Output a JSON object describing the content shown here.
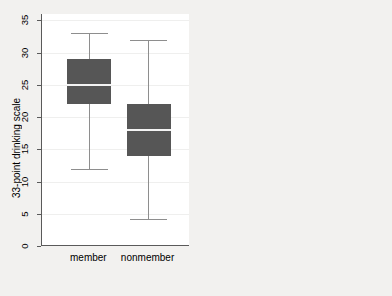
{
  "chart_data": [
    {
      "type": "box",
      "panel": "left",
      "title": "",
      "xlabel": "",
      "ylabel": "33-point drinking scale",
      "ylim": [
        0,
        36
      ],
      "yticks": [
        0,
        5,
        10,
        15,
        20,
        25,
        30,
        35
      ],
      "ytick_labels": [
        "0",
        "5",
        "10",
        "15",
        "20",
        "25",
        "30",
        "35"
      ],
      "grid": true,
      "legend": "none",
      "categories": [
        "member",
        "nonmember"
      ],
      "boxes": [
        {
          "name": "member",
          "whisker_low": 12,
          "q1": 22,
          "median": 25,
          "q3": 29,
          "whisker_high": 33
        },
        {
          "name": "nonmember",
          "whisker_low": 4.2,
          "q1": 14,
          "median": 18,
          "q3": 22,
          "whisker_high": 32
        }
      ],
      "fill_color": "#565656",
      "median_color": "#f3f3f3",
      "whisker_color": "#8e8e8e"
    },
    {
      "type": "bar",
      "panel": "right",
      "title": "",
      "xlabel": "",
      "ylabel": "mean of drink",
      "ylim": [
        0,
        36
      ],
      "yticks": [
        0,
        5,
        10,
        15,
        20,
        25,
        30,
        35
      ],
      "ytick_labels": [
        "0",
        "5",
        "10",
        "15",
        "20",
        "25",
        "30",
        "35"
      ],
      "grid": true,
      "legend": "none",
      "categories": [
        "member",
        "nonmember"
      ],
      "values": [
        24.8,
        17.8
      ],
      "fill_color": "#565656"
    }
  ],
  "left_panel": {
    "y_axis_title": "33-point drinking scale",
    "tick_labels": [
      "35",
      "30",
      "25",
      "20",
      "15",
      "10",
      "5",
      "0"
    ],
    "category_labels": [
      "member",
      "nonmember"
    ]
  },
  "right_panel": {
    "y_axis_title": "mean of drink",
    "tick_labels": [
      "35",
      "30",
      "25",
      "20",
      "15",
      "10",
      "5",
      "0"
    ],
    "category_labels": [
      "member",
      "nonmember"
    ]
  }
}
